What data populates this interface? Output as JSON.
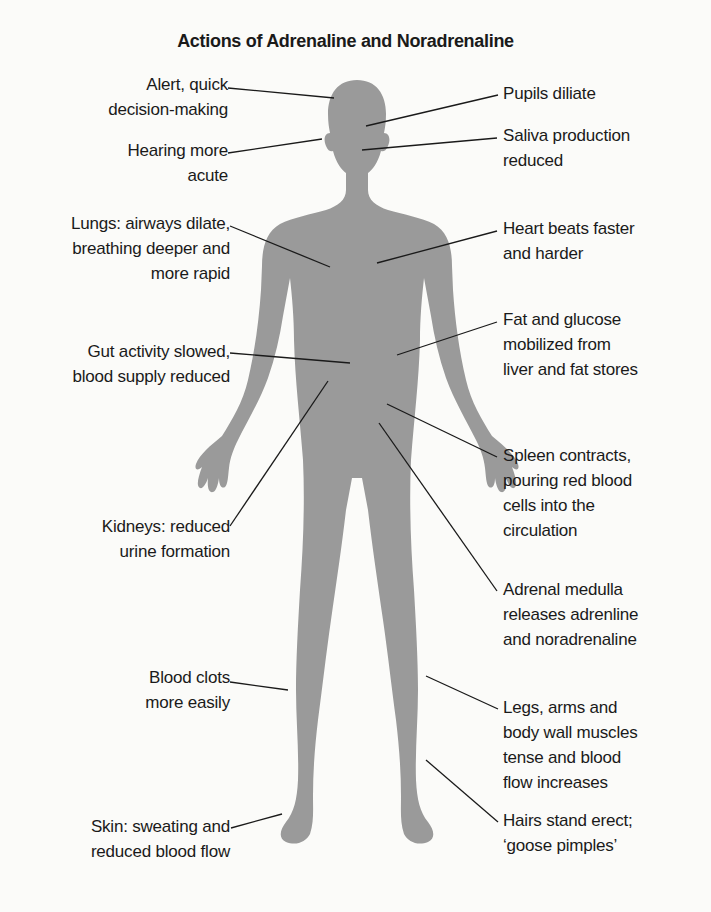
{
  "title": "Actions of Adrenaline and Noradrenaline",
  "colors": {
    "background": "#fbfbf9",
    "silhouette": "#9a9a9a",
    "text": "#1a1a1a",
    "leader_line": "#1a1a1a"
  },
  "labels_left": [
    {
      "id": "alert",
      "text": "Alert, quick\ndecision-making"
    },
    {
      "id": "hearing",
      "text": "Hearing more\nacute"
    },
    {
      "id": "lungs",
      "text": "Lungs: airways dilate,\nbreathing deeper and\nmore rapid"
    },
    {
      "id": "gut",
      "text": "Gut activity slowed,\nblood supply reduced"
    },
    {
      "id": "kidneys",
      "text": "Kidneys: reduced\nurine formation"
    },
    {
      "id": "blood-clots",
      "text": "Blood clots\nmore easily"
    },
    {
      "id": "skin",
      "text": "Skin: sweating and\nreduced blood flow"
    }
  ],
  "labels_right": [
    {
      "id": "pupils",
      "text": "Pupils diliate"
    },
    {
      "id": "saliva",
      "text": "Saliva production\nreduced"
    },
    {
      "id": "heart",
      "text": "Heart beats faster\nand harder"
    },
    {
      "id": "fat-glucose",
      "text": "Fat and glucose\nmobilized from\nliver and fat stores"
    },
    {
      "id": "spleen",
      "text": "Spleen contracts,\npouring red blood\ncells into the\ncirculation"
    },
    {
      "id": "adrenal",
      "text": "Adrenal medulla\nreleases adrenline\nand noradrenaline"
    },
    {
      "id": "muscles",
      "text": "Legs, arms and\nbody wall muscles\ntense and blood\nflow increases"
    },
    {
      "id": "hairs",
      "text": "Hairs stand erect;\n‘goose pimples’"
    }
  ]
}
